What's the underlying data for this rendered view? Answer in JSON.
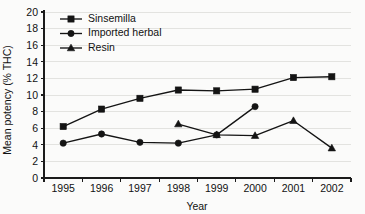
{
  "chart_data": {
    "type": "line",
    "title": "",
    "xlabel": "Year",
    "ylabel": "Mean potency (% THC)",
    "categories": [
      "1995",
      "1996",
      "1997",
      "1998",
      "1999",
      "2000",
      "2001",
      "2002"
    ],
    "ylim": [
      0,
      20
    ],
    "ytick_labels": [
      "0",
      "2",
      "4",
      "6",
      "8",
      "10",
      "12",
      "14",
      "16",
      "18",
      "20"
    ],
    "ytick_values": [
      0,
      2,
      4,
      6,
      8,
      10,
      12,
      14,
      16,
      18,
      20
    ],
    "grid": "horizontal-faint",
    "legend_position": "top-left-inside",
    "series": [
      {
        "name": "Sinsemilla",
        "marker": "square",
        "x": [
          "1995",
          "1996",
          "1997",
          "1998",
          "1999",
          "2000",
          "2001",
          "2002"
        ],
        "values": [
          6.2,
          8.3,
          9.6,
          10.6,
          10.5,
          10.7,
          12.1,
          12.2
        ]
      },
      {
        "name": "Imported herbal",
        "marker": "circle",
        "x": [
          "1995",
          "1996",
          "1997",
          "1998",
          "1999",
          "2000"
        ],
        "values": [
          4.2,
          5.3,
          4.3,
          4.2,
          5.2,
          8.6
        ]
      },
      {
        "name": "Resin",
        "marker": "triangle",
        "x": [
          "1998",
          "1999",
          "2000",
          "2001",
          "2002"
        ],
        "values": [
          6.5,
          5.2,
          5.1,
          6.9,
          3.6
        ]
      }
    ]
  },
  "axes": {
    "y_title": "Mean potency (% THC)",
    "x_title": "Year",
    "y_ticks": [
      {
        "label": "20",
        "value": 20
      },
      {
        "label": "18",
        "value": 18
      },
      {
        "label": "16",
        "value": 16
      },
      {
        "label": "14",
        "value": 14
      },
      {
        "label": "12",
        "value": 12
      },
      {
        "label": "10",
        "value": 10
      },
      {
        "label": "8",
        "value": 8
      },
      {
        "label": "6",
        "value": 6
      },
      {
        "label": "4",
        "value": 4
      },
      {
        "label": "2",
        "value": 2
      },
      {
        "label": "0",
        "value": 0
      }
    ],
    "x_ticks": [
      {
        "label": "1995"
      },
      {
        "label": "1996"
      },
      {
        "label": "1997"
      },
      {
        "label": "1998"
      },
      {
        "label": "1999"
      },
      {
        "label": "2000"
      },
      {
        "label": "2001"
      },
      {
        "label": "2002"
      }
    ]
  },
  "legend": {
    "entries": [
      {
        "label": "Sinsemilla",
        "marker": "square"
      },
      {
        "label": "Imported herbal",
        "marker": "circle"
      },
      {
        "label": "Resin",
        "marker": "triangle"
      }
    ]
  }
}
